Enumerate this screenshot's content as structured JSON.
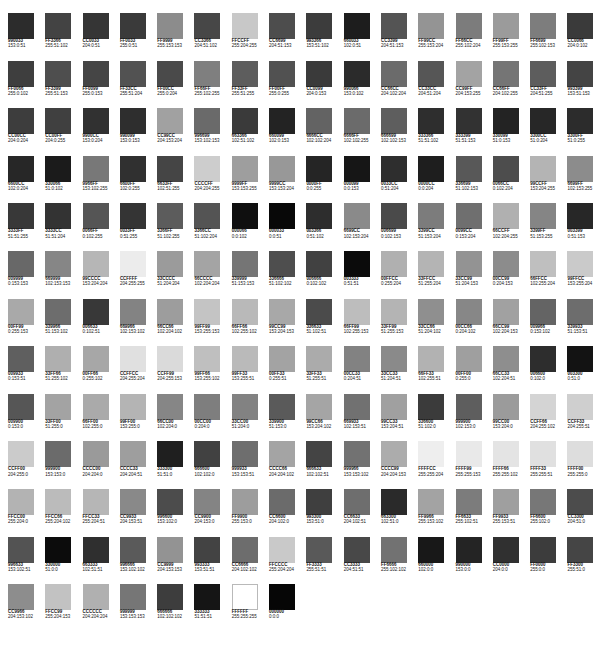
{
  "document": {
    "title": "Web-Safe Color Palette Chart",
    "kind": "color-swatch-sheet",
    "columns": 16,
    "rows": 14,
    "total_swatches": 216,
    "background_color": "#FFFFFF",
    "label_color": "#141414",
    "rendering_note": "Swatch fills are reproduced as desaturated grayscale tones; labels state the nominal hex and RGB values."
  },
  "chart_data": {
    "type": "table",
    "xlabel": "",
    "ylabel": "",
    "columns": 16,
    "legend": "",
    "grid": false,
    "swatches": [
      {
        "hex": "990033",
        "rgb": "153:0:51",
        "fill": "#2c2c2c"
      },
      {
        "hex": "FF3366",
        "rgb": "255:51:102",
        "fill": "#434343"
      },
      {
        "hex": "CC0033",
        "rgb": "204:0:51",
        "fill": "#353535"
      },
      {
        "hex": "FF0033",
        "rgb": "255:0:51",
        "fill": "#3a3a3a"
      },
      {
        "hex": "FF9999",
        "rgb": "255:153:153",
        "fill": "#8c8c8c"
      },
      {
        "hex": "CC3366",
        "rgb": "204:51:102",
        "fill": "#474747"
      },
      {
        "hex": "FFCCFF",
        "rgb": "255:204:255",
        "fill": "#c8c8c8"
      },
      {
        "hex": "CC6699",
        "rgb": "204:51:153",
        "fill": "#4d4d4d"
      },
      {
        "hex": "993366",
        "rgb": "153:51:102",
        "fill": "#3c3c3c"
      },
      {
        "hex": "660033",
        "rgb": "102:0:51",
        "fill": "#1d1d1d"
      },
      {
        "hex": "CC3399",
        "rgb": "204:51:153",
        "fill": "#545454"
      },
      {
        "hex": "FF99CC",
        "rgb": "255:153:204",
        "fill": "#949494"
      },
      {
        "hex": "FF66CC",
        "rgb": "255:102:204",
        "fill": "#7c7c7c"
      },
      {
        "hex": "FF99FF",
        "rgb": "255:153:255",
        "fill": "#9b9b9b"
      },
      {
        "hex": "FF6699",
        "rgb": "255:102:153",
        "fill": "#7d7d7d"
      },
      {
        "hex": "CC0066",
        "rgb": "204:0:102",
        "fill": "#3a3a3a"
      },
      {
        "hex": "FF0066",
        "rgb": "255:0:102",
        "fill": "#3e3e3e"
      },
      {
        "hex": "FF3399",
        "rgb": "255:51:153",
        "fill": "#4e4e4e"
      },
      {
        "hex": "FF0099",
        "rgb": "255:0:153",
        "fill": "#454545"
      },
      {
        "hex": "FF33CC",
        "rgb": "255:51:204",
        "fill": "#525252"
      },
      {
        "hex": "FF00CC",
        "rgb": "255:0:204",
        "fill": "#4a4a4a"
      },
      {
        "hex": "FF66FF",
        "rgb": "255:102:255",
        "fill": "#7f7f7f"
      },
      {
        "hex": "FF33FF",
        "rgb": "255:51:255",
        "fill": "#5d5d5d"
      },
      {
        "hex": "FF00FF",
        "rgb": "255:0:255",
        "fill": "#515151"
      },
      {
        "hex": "CC0099",
        "rgb": "204:0:153",
        "fill": "#3a3a3a"
      },
      {
        "hex": "990066",
        "rgb": "153:0:102",
        "fill": "#2b2b2b"
      },
      {
        "hex": "CC66CC",
        "rgb": "204:102:204",
        "fill": "#6b6b6b"
      },
      {
        "hex": "CC33CC",
        "rgb": "204:51:204",
        "fill": "#565656"
      },
      {
        "hex": "CC99FF",
        "rgb": "204:153:255",
        "fill": "#a3a3a3"
      },
      {
        "hex": "CC66FF",
        "rgb": "204:102:255",
        "fill": "#757575"
      },
      {
        "hex": "CC33FF",
        "rgb": "204:51:255",
        "fill": "#5d5d5d"
      },
      {
        "hex": "993399",
        "rgb": "153:51:153",
        "fill": "#444444"
      },
      {
        "hex": "CC00CC",
        "rgb": "204:0:204",
        "fill": "#3d3d3d"
      },
      {
        "hex": "CC00FF",
        "rgb": "204:0:255",
        "fill": "#404040"
      },
      {
        "hex": "9900CC",
        "rgb": "153:0:204",
        "fill": "#313131"
      },
      {
        "hex": "990099",
        "rgb": "153:0:153",
        "fill": "#2e2e2e"
      },
      {
        "hex": "CC99CC",
        "rgb": "204:153:204",
        "fill": "#a1a1a1"
      },
      {
        "hex": "996699",
        "rgb": "153:102:153",
        "fill": "#6a6a6a"
      },
      {
        "hex": "663366",
        "rgb": "102:51:102",
        "fill": "#3a3a3a"
      },
      {
        "hex": "660099",
        "rgb": "102:0:153",
        "fill": "#232323"
      },
      {
        "hex": "6666CC",
        "rgb": "102:102:204",
        "fill": "#636363"
      },
      {
        "hex": "6666FF",
        "rgb": "102:102:255",
        "fill": "#6b6b6b"
      },
      {
        "hex": "666699",
        "rgb": "102:102:153",
        "fill": "#5e5e5e"
      },
      {
        "hex": "333366",
        "rgb": "51:51:102",
        "fill": "#2e2e2e"
      },
      {
        "hex": "333399",
        "rgb": "51:51:153",
        "fill": "#323232"
      },
      {
        "hex": "330099",
        "rgb": "51:0:153",
        "fill": "#232323"
      },
      {
        "hex": "3300CC",
        "rgb": "51:0:204",
        "fill": "#272727"
      },
      {
        "hex": "3300FF",
        "rgb": "51:0:255",
        "fill": "#2c2c2c"
      },
      {
        "hex": "6600CC",
        "rgb": "102:0:204",
        "fill": "#272727"
      },
      {
        "hex": "330066",
        "rgb": "51:0:102",
        "fill": "#1b1b1b"
      },
      {
        "hex": "9966FF",
        "rgb": "153:102:255",
        "fill": "#787878"
      },
      {
        "hex": "6600FF",
        "rgb": "102:0:255",
        "fill": "#303030"
      },
      {
        "hex": "6633FF",
        "rgb": "102:51:255",
        "fill": "#454545"
      },
      {
        "hex": "CCCCFF",
        "rgb": "204:204:255",
        "fill": "#cdcdcd"
      },
      {
        "hex": "9999FF",
        "rgb": "153:153:255",
        "fill": "#9e9e9e"
      },
      {
        "hex": "9999CC",
        "rgb": "153:153:204",
        "fill": "#989898"
      },
      {
        "hex": "0000FF",
        "rgb": "0:0:255",
        "fill": "#252525"
      },
      {
        "hex": "000099",
        "rgb": "0:0:153",
        "fill": "#161616"
      },
      {
        "hex": "0033CC",
        "rgb": "0:51:204",
        "fill": "#2e2e2e"
      },
      {
        "hex": "0000CC",
        "rgb": "0:0:204",
        "fill": "#1e1e1e"
      },
      {
        "hex": "336699",
        "rgb": "51:102:153",
        "fill": "#585858"
      },
      {
        "hex": "0066CC",
        "rgb": "0:102:204",
        "fill": "#4d4d4d"
      },
      {
        "hex": "99CCFF",
        "rgb": "153:204:255",
        "fill": "#b4b4b4"
      },
      {
        "hex": "6699FF",
        "rgb": "102:153:255",
        "fill": "#8c8c8c"
      },
      {
        "hex": "3333FF",
        "rgb": "51:51:255",
        "fill": "#383838"
      },
      {
        "hex": "3333CC",
        "rgb": "51:51:204",
        "fill": "#333333"
      },
      {
        "hex": "0066FF",
        "rgb": "0:102:255",
        "fill": "#555555"
      },
      {
        "hex": "0033FF",
        "rgb": "0:51:255",
        "fill": "#343434"
      },
      {
        "hex": "3366FF",
        "rgb": "51:102:255",
        "fill": "#5c5c5c"
      },
      {
        "hex": "3366CC",
        "rgb": "51:102:204",
        "fill": "#545454"
      },
      {
        "hex": "000066",
        "rgb": "0:0:102",
        "fill": "#0f0f0f"
      },
      {
        "hex": "000033",
        "rgb": "0:0:51",
        "fill": "#080808"
      },
      {
        "hex": "003366",
        "rgb": "0:51:102",
        "fill": "#2d2d2d"
      },
      {
        "hex": "6699CC",
        "rgb": "102:153:204",
        "fill": "#8a8a8a"
      },
      {
        "hex": "006699",
        "rgb": "0:102:153",
        "fill": "#4a4a4a"
      },
      {
        "hex": "3399CC",
        "rgb": "51:153:204",
        "fill": "#7c7c7c"
      },
      {
        "hex": "0099CC",
        "rgb": "0:153:204",
        "fill": "#6f6f6f"
      },
      {
        "hex": "66CCFF",
        "rgb": "102:204:255",
        "fill": "#b0b0b0"
      },
      {
        "hex": "3399FF",
        "rgb": "51:153:255",
        "fill": "#858585"
      },
      {
        "hex": "003399",
        "rgb": "0:51:153",
        "fill": "#272727"
      },
      {
        "hex": "009999",
        "rgb": "0:153:153",
        "fill": "#686868"
      },
      {
        "hex": "669999",
        "rgb": "102:153:153",
        "fill": "#868686"
      },
      {
        "hex": "99CCCC",
        "rgb": "153:204:204",
        "fill": "#b6b6b6"
      },
      {
        "hex": "CCFFFF",
        "rgb": "204:255:255",
        "fill": "#ececec"
      },
      {
        "hex": "33CCCC",
        "rgb": "51:204:204",
        "fill": "#9b9b9b"
      },
      {
        "hex": "66CCCC",
        "rgb": "102:204:204",
        "fill": "#a4a4a4"
      },
      {
        "hex": "339999",
        "rgb": "51:153:153",
        "fill": "#757575"
      },
      {
        "hex": "336666",
        "rgb": "51:102:102",
        "fill": "#4e4e4e"
      },
      {
        "hex": "006666",
        "rgb": "0:102:102",
        "fill": "#414141"
      },
      {
        "hex": "003333",
        "rgb": "0:51:51",
        "fill": "#0b0b0b"
      },
      {
        "hex": "00FFCC",
        "rgb": "0:255:204",
        "fill": "#b0b0b0"
      },
      {
        "hex": "33FFCC",
        "rgb": "51:255:204",
        "fill": "#b4b4b4"
      },
      {
        "hex": "33CC99",
        "rgb": "51:204:153",
        "fill": "#939393"
      },
      {
        "hex": "00CC99",
        "rgb": "0:204:153",
        "fill": "#8c8c8c"
      },
      {
        "hex": "66FFCC",
        "rgb": "102:255:204",
        "fill": "#bfbfbf"
      },
      {
        "hex": "99FFCC",
        "rgb": "153:255:204",
        "fill": "#cacaca"
      },
      {
        "hex": "00FF99",
        "rgb": "0:255:153",
        "fill": "#a9a9a9"
      },
      {
        "hex": "339966",
        "rgb": "51:153:102",
        "fill": "#6d6d6d"
      },
      {
        "hex": "006633",
        "rgb": "0:102:51",
        "fill": "#383838"
      },
      {
        "hex": "669966",
        "rgb": "102:153:102",
        "fill": "#838383"
      },
      {
        "hex": "66CC66",
        "rgb": "102:204:102",
        "fill": "#9d9d9d"
      },
      {
        "hex": "99FF99",
        "rgb": "153:255:153",
        "fill": "#c4c4c4"
      },
      {
        "hex": "66FF66",
        "rgb": "102:255:102",
        "fill": "#b9b9b9"
      },
      {
        "hex": "99CC99",
        "rgb": "153:204:153",
        "fill": "#a8a8a8"
      },
      {
        "hex": "336633",
        "rgb": "51:102:51",
        "fill": "#4b4b4b"
      },
      {
        "hex": "66FF99",
        "rgb": "102:255:153",
        "fill": "#bdbdbd"
      },
      {
        "hex": "33FF99",
        "rgb": "51:255:153",
        "fill": "#b4b4b4"
      },
      {
        "hex": "33CC66",
        "rgb": "51:204:102",
        "fill": "#8f8f8f"
      },
      {
        "hex": "00CC66",
        "rgb": "0:204:102",
        "fill": "#878787"
      },
      {
        "hex": "66CC99",
        "rgb": "102:204:153",
        "fill": "#a1a1a1"
      },
      {
        "hex": "009966",
        "rgb": "0:153:102",
        "fill": "#646464"
      },
      {
        "hex": "339933",
        "rgb": "51:153:51",
        "fill": "#6d6d6d"
      },
      {
        "hex": "009933",
        "rgb": "0:153:51",
        "fill": "#5f5f5f"
      },
      {
        "hex": "33FF66",
        "rgb": "51:255:102",
        "fill": "#afafaf"
      },
      {
        "hex": "00FF66",
        "rgb": "0:255:102",
        "fill": "#a7a7a7"
      },
      {
        "hex": "CCFFCC",
        "rgb": "204:255:204",
        "fill": "#e0e0e0"
      },
      {
        "hex": "CCFF99",
        "rgb": "204:255:153",
        "fill": "#dadada"
      },
      {
        "hex": "99FF66",
        "rgb": "153:255:102",
        "fill": "#bfbfbf"
      },
      {
        "hex": "99FF33",
        "rgb": "153:255:51",
        "fill": "#bababa"
      },
      {
        "hex": "00FF33",
        "rgb": "0:255:51",
        "fill": "#a3a3a3"
      },
      {
        "hex": "33FF33",
        "rgb": "51:255:51",
        "fill": "#ababab"
      },
      {
        "hex": "00CC33",
        "rgb": "0:204:51",
        "fill": "#828282"
      },
      {
        "hex": "33CC33",
        "rgb": "51:204:51",
        "fill": "#8a8a8a"
      },
      {
        "hex": "66FF33",
        "rgb": "102:255:51",
        "fill": "#b2b2b2"
      },
      {
        "hex": "00FF00",
        "rgb": "0:255:0",
        "fill": "#9f9f9f"
      },
      {
        "hex": "66CC33",
        "rgb": "102:204:51",
        "fill": "#8e8e8e"
      },
      {
        "hex": "006600",
        "rgb": "0:102:0",
        "fill": "#2d2d2d"
      },
      {
        "hex": "003300",
        "rgb": "0:51:0",
        "fill": "#131313"
      },
      {
        "hex": "009900",
        "rgb": "0:153:0",
        "fill": "#565656"
      },
      {
        "hex": "33FF00",
        "rgb": "51:255:0",
        "fill": "#a3a3a3"
      },
      {
        "hex": "66FF00",
        "rgb": "102:255:0",
        "fill": "#aaaaaa"
      },
      {
        "hex": "99FF00",
        "rgb": "153:255:0",
        "fill": "#b4b4b4"
      },
      {
        "hex": "66CC00",
        "rgb": "102:204:0",
        "fill": "#868686"
      },
      {
        "hex": "00CC00",
        "rgb": "0:204:0",
        "fill": "#7e7e7e"
      },
      {
        "hex": "33CC00",
        "rgb": "51:204:0",
        "fill": "#828282"
      },
      {
        "hex": "339900",
        "rgb": "51:153:0",
        "fill": "#5a5a5a"
      },
      {
        "hex": "99CC66",
        "rgb": "153:204:102",
        "fill": "#a5a5a5"
      },
      {
        "hex": "669933",
        "rgb": "102:153:51",
        "fill": "#717171"
      },
      {
        "hex": "99CC33",
        "rgb": "153:204:51",
        "fill": "#a0a0a0"
      },
      {
        "hex": "336600",
        "rgb": "51:102:0",
        "fill": "#3b3b3b"
      },
      {
        "hex": "999900",
        "rgb": "102:153:0",
        "fill": "#5e5e5e"
      },
      {
        "hex": "99CC00",
        "rgb": "153:204:0",
        "fill": "#9b9b9b"
      },
      {
        "hex": "CCFF66",
        "rgb": "204:255:102",
        "fill": "#d4d4d4"
      },
      {
        "hex": "CCFF33",
        "rgb": "204:255:51",
        "fill": "#cfcfcf"
      },
      {
        "hex": "CCFF00",
        "rgb": "204:255:0",
        "fill": "#cbcbcb"
      },
      {
        "hex": "999900",
        "rgb": "153:153:0",
        "fill": "#6b6b6b"
      },
      {
        "hex": "CCCC00",
        "rgb": "204:204:0",
        "fill": "#9a9a9a"
      },
      {
        "hex": "CCCC33",
        "rgb": "204:204:51",
        "fill": "#9e9e9e"
      },
      {
        "hex": "333300",
        "rgb": "51:51:0",
        "fill": "#1f1f1f"
      },
      {
        "hex": "666600",
        "rgb": "102:102:0",
        "fill": "#414141"
      },
      {
        "hex": "999933",
        "rgb": "153:153:51",
        "fill": "#6e6e6e"
      },
      {
        "hex": "CCCC66",
        "rgb": "204:204:102",
        "fill": "#a4a4a4"
      },
      {
        "hex": "666633",
        "rgb": "102:102:51",
        "fill": "#444444"
      },
      {
        "hex": "999966",
        "rgb": "153:153:102",
        "fill": "#727272"
      },
      {
        "hex": "CCCC99",
        "rgb": "204:204:153",
        "fill": "#acacac"
      },
      {
        "hex": "FFFFCC",
        "rgb": "255:255:204",
        "fill": "#eeeeee"
      },
      {
        "hex": "FFFF99",
        "rgb": "255:255:153",
        "fill": "#e9e9e9"
      },
      {
        "hex": "FFFF66",
        "rgb": "255:255:102",
        "fill": "#e4e4e4"
      },
      {
        "hex": "FFFF33",
        "rgb": "255:255:51",
        "fill": "#e0e0e0"
      },
      {
        "hex": "FFFF00",
        "rgb": "255:255:0",
        "fill": "#dddddd"
      },
      {
        "hex": "FFCC00",
        "rgb": "255:204:0",
        "fill": "#b3b3b3"
      },
      {
        "hex": "FFCC66",
        "rgb": "255:204:102",
        "fill": "#bbbbbb"
      },
      {
        "hex": "FFCC33",
        "rgb": "255:204:51",
        "fill": "#b6b6b6"
      },
      {
        "hex": "CC9933",
        "rgb": "204:153:51",
        "fill": "#898989"
      },
      {
        "hex": "996600",
        "rgb": "153:102:0",
        "fill": "#4c4c4c"
      },
      {
        "hex": "CC9900",
        "rgb": "204:153:0",
        "fill": "#848484"
      },
      {
        "hex": "FF9900",
        "rgb": "255:153:0",
        "fill": "#9d9d9d"
      },
      {
        "hex": "CC6600",
        "rgb": "204:102:0",
        "fill": "#6b6b6b"
      },
      {
        "hex": "993300",
        "rgb": "153:51:0",
        "fill": "#3f3f3f"
      },
      {
        "hex": "CC6633",
        "rgb": "204:102:51",
        "fill": "#6e6e6e"
      },
      {
        "hex": "663300",
        "rgb": "102:51:0",
        "fill": "#2a2a2a"
      },
      {
        "hex": "FF9966",
        "rgb": "255:153:102",
        "fill": "#a3a3a3"
      },
      {
        "hex": "FF6633",
        "rgb": "255:102:51",
        "fill": "#7c7c7c"
      },
      {
        "hex": "FF9933",
        "rgb": "255:153:51",
        "fill": "#9f9f9f"
      },
      {
        "hex": "FF6600",
        "rgb": "255:102:0",
        "fill": "#777777"
      },
      {
        "hex": "CC3300",
        "rgb": "204:51:0",
        "fill": "#4c4c4c"
      },
      {
        "hex": "996633",
        "rgb": "153:102:51",
        "fill": "#535353"
      },
      {
        "hex": "330000",
        "rgb": "51:0:0",
        "fill": "#0c0c0c"
      },
      {
        "hex": "663333",
        "rgb": "102:51:51",
        "fill": "#2f2f2f"
      },
      {
        "hex": "996666",
        "rgb": "153:102:102",
        "fill": "#5a5a5a"
      },
      {
        "hex": "CC9999",
        "rgb": "204:153:153",
        "fill": "#939393"
      },
      {
        "hex": "993333",
        "rgb": "153:51:51",
        "fill": "#434343"
      },
      {
        "hex": "CC6666",
        "rgb": "204:102:102",
        "fill": "#6d6d6d"
      },
      {
        "hex": "FFCCCC",
        "rgb": "255:204:204",
        "fill": "#c9c9c9"
      },
      {
        "hex": "FF3333",
        "rgb": "255:51:51",
        "fill": "#595959"
      },
      {
        "hex": "CC3333",
        "rgb": "204:51:51",
        "fill": "#484848"
      },
      {
        "hex": "FF6666",
        "rgb": "255:102:102",
        "fill": "#727272"
      },
      {
        "hex": "660000",
        "rgb": "102:0:0",
        "fill": "#181818"
      },
      {
        "hex": "990000",
        "rgb": "153:0:0",
        "fill": "#242424"
      },
      {
        "hex": "CC0000",
        "rgb": "204:0:0",
        "fill": "#303030"
      },
      {
        "hex": "FF0000",
        "rgb": "255:0:0",
        "fill": "#3c3c3c"
      },
      {
        "hex": "FF3300",
        "rgb": "255:51:0",
        "fill": "#454545"
      },
      {
        "hex": "CC9966",
        "rgb": "204:153:102",
        "fill": "#8d8d8d"
      },
      {
        "hex": "FFCC99",
        "rgb": "255:204:153",
        "fill": "#c2c2c2"
      },
      {
        "hex": "CCCCCC",
        "rgb": "204:204:204",
        "fill": "#b0b0b0"
      },
      {
        "hex": "999999",
        "rgb": "153:153:153",
        "fill": "#767676"
      },
      {
        "hex": "666666",
        "rgb": "102:102:102",
        "fill": "#3d3d3d"
      },
      {
        "hex": "333333",
        "rgb": "51:51:51",
        "fill": "#151515"
      },
      {
        "hex": "FFFFFF",
        "rgb": "255:255:255",
        "fill": "#ffffff"
      },
      {
        "hex": "000000",
        "rgb": "0:0:0",
        "fill": "#060606"
      }
    ]
  }
}
